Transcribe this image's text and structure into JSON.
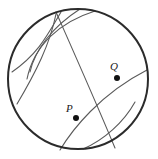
{
  "figure": {
    "kind": "geometry-construction-diagram",
    "background_color": "#ffffff",
    "stroke_color_primary": "#2b2b2b",
    "stroke_color_arc": "#5a5a5a",
    "point_fill": "#111111",
    "canvas": {
      "width": 158,
      "height": 159
    },
    "main_circle": {
      "name": "main-circle",
      "cx": 78,
      "cy": 79,
      "r": 70,
      "stroke_width": 2.0
    },
    "points": [
      {
        "id": "P",
        "label": "P",
        "cx": 76,
        "cy": 118,
        "marker_size": 3.0,
        "label_x": 66,
        "label_y": 112
      },
      {
        "id": "Q",
        "label": "Q",
        "cx": 117,
        "cy": 78,
        "marker_size": 3.0,
        "label_x": 110,
        "label_y": 70
      }
    ],
    "arcs": [
      {
        "name": "arc-upper-left-large",
        "d": "M 95 11 C 60 22, 34 45, 27 79",
        "stroke_width": 1.1
      },
      {
        "name": "arc-upper-left-inner",
        "d": "M 80 9 C 52 27, 35 50, 30 72",
        "stroke_width": 1.1
      },
      {
        "name": "arc-left-sweep",
        "d": "M 61 12 C 47 36, 38 54, 12 72",
        "stroke_width": 1.1
      },
      {
        "name": "arc-left-lower-sweep",
        "d": "M 56 14 C 50 44, 36 72, 17 104",
        "stroke_width": 1.1
      },
      {
        "name": "chord-through-P-steep",
        "d": "M 56 12 C 75 55, 95 100, 115 148",
        "stroke_width": 1.1
      },
      {
        "name": "arc-through-P-and-Q",
        "d": "M 60 150 C 72 130, 100 94, 147 70",
        "stroke_width": 1.1
      },
      {
        "name": "arc-bottom-right",
        "d": "M 83 149 C 104 140, 124 122, 135 102",
        "stroke_width": 1.1
      }
    ]
  },
  "accessibility": {
    "alt_text": "A circle containing several intersecting construction arcs, with two interior points labeled P and Q lying on one arc."
  }
}
